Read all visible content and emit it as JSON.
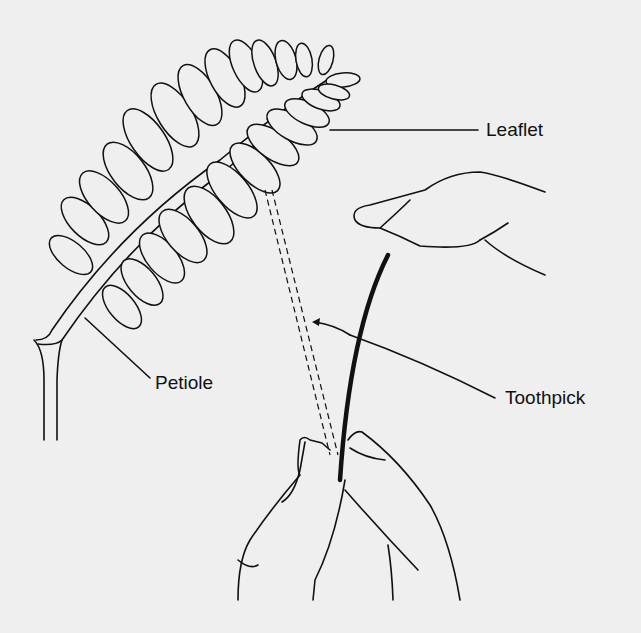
{
  "diagram": {
    "type": "labeled-illustration",
    "labels": {
      "leaflet": "Leaflet",
      "petiole": "Petiole",
      "toothpick": "Toothpick"
    },
    "colors": {
      "background": "#efefef",
      "ink": "#111111"
    }
  }
}
